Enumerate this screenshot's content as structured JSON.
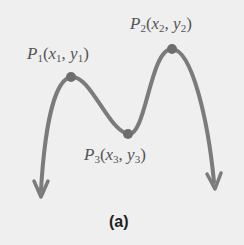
{
  "figure": {
    "caption": "(a)",
    "points": [
      {
        "name": "P",
        "index": "1",
        "x": "x",
        "y": "y",
        "px": 71,
        "py": 77
      },
      {
        "name": "P",
        "index": "2",
        "x": "x",
        "y": "y",
        "px": 172,
        "py": 49
      },
      {
        "name": "P",
        "index": "3",
        "x": "x",
        "y": "y",
        "px": 128,
        "py": 134
      }
    ],
    "colors": {
      "background": "#efefef",
      "curve": "#7b7b7b",
      "label": "#555555"
    }
  }
}
